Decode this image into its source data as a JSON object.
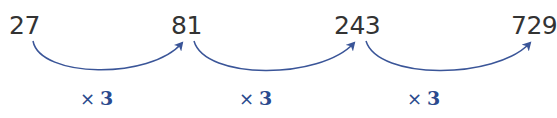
{
  "sequence": {
    "terms": [
      "27",
      "81",
      "243",
      "729"
    ],
    "operations": [
      {
        "symbol": "×",
        "value": "3"
      },
      {
        "symbol": "×",
        "value": "3"
      },
      {
        "symbol": "×",
        "value": "3"
      }
    ]
  },
  "colors": {
    "number_text": "#333333",
    "arrow": "#3a5598",
    "operation_text": "#2b4a8e"
  }
}
